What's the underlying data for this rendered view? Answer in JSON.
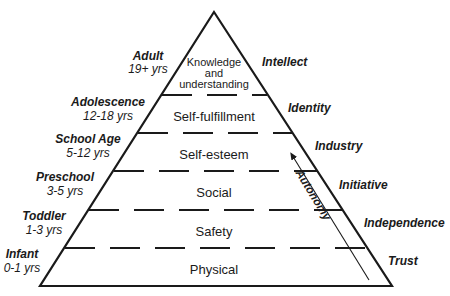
{
  "diagram": {
    "type": "pyramid",
    "colors": {
      "line": "#1a1a1a",
      "background": "#ffffff"
    },
    "levels": [
      {
        "label": "Physical"
      },
      {
        "label": "Safety"
      },
      {
        "label": "Social"
      },
      {
        "label": "Self-esteem"
      },
      {
        "label": "Self-fulfillment"
      },
      {
        "label_lines": [
          "Knowledge",
          "and",
          "understanding"
        ]
      }
    ],
    "stages": [
      {
        "name": "Infant",
        "age": "0-1 yrs"
      },
      {
        "name": "Toddler",
        "age": "1-3 yrs"
      },
      {
        "name": "Preschool",
        "age": "3-5 yrs"
      },
      {
        "name": "School Age",
        "age": "5-12 yrs"
      },
      {
        "name": "Adolescence",
        "age": "12-18 yrs"
      },
      {
        "name": "Adult",
        "age": "19+ yrs"
      }
    ],
    "psychosocial": [
      {
        "label": "Trust"
      },
      {
        "label": "Independence"
      },
      {
        "label": "Initiative"
      },
      {
        "label": "Industry"
      },
      {
        "label": "Identity"
      },
      {
        "label": "Intellect"
      }
    ],
    "arrow": {
      "label": "Autonomy",
      "direction": "up"
    }
  }
}
